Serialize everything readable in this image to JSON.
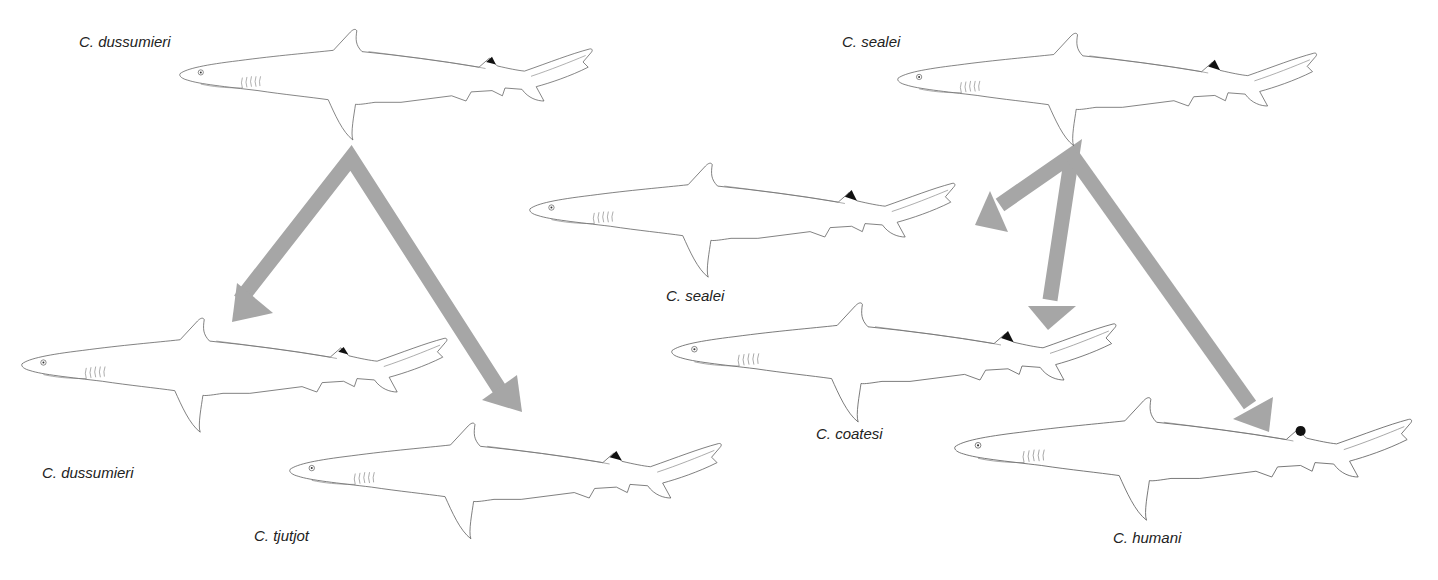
{
  "figure": {
    "type": "species-split diagram",
    "arrow_color": "#a6a6a6",
    "fin_tip_color": "#111111"
  },
  "groups": [
    {
      "parent": {
        "label": "C. dussumieri"
      },
      "children": [
        {
          "label": "C. dussumieri"
        },
        {
          "label": "C. tjutjot"
        }
      ]
    },
    {
      "parent": {
        "label": "C. sealei"
      },
      "children": [
        {
          "label": "C. sealei"
        },
        {
          "label": "C. coatesi"
        },
        {
          "label": "C. humani"
        }
      ]
    }
  ]
}
